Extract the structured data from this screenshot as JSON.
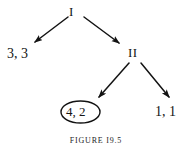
{
  "figure": {
    "caption": "FIGURE I9.5",
    "background_color": "#ffffff",
    "ink_color": "#151515"
  },
  "nodes": [
    {
      "id": "player-1",
      "label": "I",
      "x": 73,
      "y": 11,
      "role": "decision-node-player-one"
    },
    {
      "id": "player-2",
      "label": "II",
      "x": 134,
      "y": 52,
      "role": "decision-node-player-two"
    }
  ],
  "payoffs": [
    {
      "id": "payoff-left",
      "label": "3, 3",
      "x": 20,
      "y": 54,
      "circled": false
    },
    {
      "id": "payoff-circled",
      "label": "4, 2",
      "x": 80,
      "y": 112,
      "circled": true
    },
    {
      "id": "payoff-right",
      "label": "1, 1",
      "x": 167,
      "y": 112,
      "circled": false
    }
  ],
  "edges": [
    {
      "id": "edge-i-to-payoff-left",
      "from": "player-1",
      "to": "payoff-left",
      "x1": 68,
      "y1": 17,
      "x2": 32,
      "y2": 44
    },
    {
      "id": "edge-i-to-player-2",
      "from": "player-1",
      "to": "player-2",
      "x1": 84,
      "y1": 17,
      "x2": 122,
      "y2": 45
    },
    {
      "id": "edge-ii-to-payoff-circled",
      "from": "player-2",
      "to": "payoff-circled",
      "x1": 129,
      "y1": 63,
      "x2": 96,
      "y2": 100
    },
    {
      "id": "edge-ii-to-payoff-right",
      "from": "player-2",
      "to": "payoff-right",
      "x1": 140,
      "y1": 63,
      "x2": 172,
      "y2": 100
    }
  ],
  "circle": {
    "id": "payoff-circle-outline",
    "cx": 80.5,
    "cy": 112,
    "rx": 19.5,
    "ry": 11
  }
}
